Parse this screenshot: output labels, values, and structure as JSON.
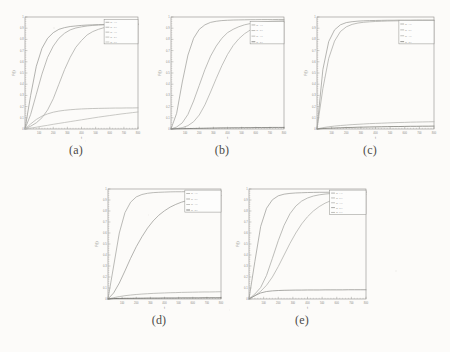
{
  "figure": {
    "background_color": "#fcfbf9",
    "panels": [
      {
        "id": "a",
        "caption": "(a)",
        "x": 12,
        "y": 14,
        "width": 128,
        "height": 126,
        "axis": {
          "xlabel": "t",
          "ylabel": "F(t)",
          "xlim": [
            0,
            800
          ],
          "ylim": [
            0,
            1
          ],
          "xticks": [
            "0",
            "100",
            "200",
            "300",
            "400",
            "500",
            "600",
            "700",
            "800"
          ],
          "yticks": [
            "0",
            "0.1",
            "0.2",
            "0.3",
            "0.4",
            "0.5",
            "0.6",
            "0.7",
            "0.8",
            "0.9",
            "1"
          ]
        },
        "legend": {
          "x": 0.7,
          "y": 0.02,
          "w": 0.3,
          "h": 0.22,
          "entries": [
            "m=1.0",
            "m=2.0",
            "m=3.0",
            "m=4.0",
            "m=5.0"
          ]
        }
      },
      {
        "id": "b",
        "caption": "(b)",
        "x": 158,
        "y": 14,
        "width": 128,
        "height": 126,
        "axis": {
          "xlabel": "t",
          "ylabel": "F(t)",
          "xlim": [
            0,
            800
          ],
          "ylim": [
            0,
            1
          ],
          "xticks": [
            "0",
            "100",
            "200",
            "300",
            "400",
            "500",
            "600",
            "700",
            "800"
          ],
          "yticks": [
            "0",
            "0.1",
            "0.2",
            "0.3",
            "0.4",
            "0.5",
            "0.6",
            "0.7",
            "0.8",
            "0.9",
            "1"
          ]
        },
        "legend": {
          "x": 0.7,
          "y": 0.04,
          "w": 0.3,
          "h": 0.2,
          "entries": [
            "m=1.0",
            "m=2.0",
            "m=3.0",
            "m=4.0"
          ]
        }
      },
      {
        "id": "c",
        "caption": "(c)",
        "x": 304,
        "y": 14,
        "width": 132,
        "height": 126,
        "axis": {
          "xlabel": "t",
          "ylabel": "F(t)",
          "xlim": [
            0,
            800
          ],
          "ylim": [
            0,
            1
          ],
          "xticks": [
            "0",
            "100",
            "200",
            "300",
            "400",
            "500",
            "600",
            "700",
            "800"
          ],
          "yticks": [
            "0",
            "0.1",
            "0.2",
            "0.3",
            "0.4",
            "0.5",
            "0.6",
            "0.7",
            "0.8",
            "0.9",
            "1"
          ]
        },
        "legend": {
          "x": 0.7,
          "y": 0.03,
          "w": 0.3,
          "h": 0.21,
          "entries": [
            "m=1.0",
            "m=2.0",
            "m=3.0",
            "m=4.0"
          ]
        }
      },
      {
        "id": "d",
        "caption": "(d)",
        "x": 95,
        "y": 186,
        "width": 128,
        "height": 124,
        "axis": {
          "xlabel": "t",
          "ylabel": "F(t)",
          "xlim": [
            0,
            800
          ],
          "ylim": [
            0,
            1
          ],
          "xticks": [
            "0",
            "100",
            "200",
            "300",
            "400",
            "500",
            "600",
            "700",
            "800"
          ],
          "yticks": [
            "0",
            "0.1",
            "0.2",
            "0.3",
            "0.4",
            "0.5",
            "0.6",
            "0.7",
            "0.8",
            "0.9",
            "1"
          ]
        },
        "legend": {
          "x": 0.68,
          "y": 0.01,
          "w": 0.32,
          "h": 0.2,
          "entries": [
            "m=1.0",
            "m=2.0",
            "m=3.0",
            "m=4.0"
          ]
        }
      },
      {
        "id": "e",
        "caption": "(e)",
        "x": 236,
        "y": 186,
        "width": 132,
        "height": 124,
        "axis": {
          "xlabel": "t",
          "ylabel": "F(t)",
          "xlim": [
            0,
            800
          ],
          "ylim": [
            0,
            1
          ],
          "xticks": [
            "0",
            "100",
            "200",
            "300",
            "400",
            "500",
            "600",
            "700",
            "800"
          ],
          "yticks": [
            "0",
            "0.1",
            "0.2",
            "0.3",
            "0.4",
            "0.5",
            "0.6",
            "0.7",
            "0.8",
            "0.9",
            "1"
          ]
        },
        "legend": {
          "x": 0.69,
          "y": 0.01,
          "w": 0.31,
          "h": 0.22,
          "entries": [
            "m=1.0",
            "m=2.0",
            "m=3.0",
            "m=4.0",
            "m=5.0"
          ]
        }
      }
    ]
  },
  "chart_data": [
    {
      "panel": "a",
      "type": "line",
      "title": "",
      "xlabel": "t",
      "ylabel": "F(t)",
      "xlim": [
        0,
        800
      ],
      "ylim": [
        0,
        1
      ],
      "grid": false,
      "legend_position": "upper-right",
      "x": [
        0,
        40,
        80,
        120,
        160,
        200,
        240,
        280,
        320,
        360,
        400,
        440,
        480,
        520,
        560,
        600,
        640,
        680,
        720,
        760,
        800
      ],
      "series": [
        {
          "name": "m=1.0",
          "color": "#9a9a96",
          "values": [
            0.0,
            0.3,
            0.56,
            0.72,
            0.81,
            0.86,
            0.89,
            0.905,
            0.915,
            0.92,
            0.925,
            0.928,
            0.93,
            0.932,
            0.933,
            0.934,
            0.935,
            0.936,
            0.936,
            0.937,
            0.937
          ]
        },
        {
          "name": "m=2.0",
          "color": "#a5a5a1",
          "values": [
            0.0,
            0.13,
            0.31,
            0.49,
            0.64,
            0.74,
            0.81,
            0.855,
            0.885,
            0.902,
            0.912,
            0.92,
            0.925,
            0.928,
            0.93,
            0.932,
            0.933,
            0.934,
            0.935,
            0.936,
            0.936
          ]
        },
        {
          "name": "m=3.0",
          "color": "#aaaaa6",
          "values": [
            0.0,
            0.025,
            0.055,
            0.1,
            0.17,
            0.27,
            0.4,
            0.53,
            0.64,
            0.73,
            0.79,
            0.84,
            0.87,
            0.89,
            0.905,
            0.915,
            0.921,
            0.925,
            0.928,
            0.93,
            0.932
          ]
        },
        {
          "name": "m=4.0",
          "color": "#b2b2ae",
          "values": [
            0.0,
            0.045,
            0.085,
            0.115,
            0.135,
            0.15,
            0.16,
            0.167,
            0.172,
            0.176,
            0.179,
            0.181,
            0.183,
            0.184,
            0.185,
            0.186,
            0.187,
            0.187,
            0.188,
            0.188,
            0.189
          ]
        },
        {
          "name": "m=5.0",
          "color": "#b8b8b4",
          "values": [
            0.0,
            0.008,
            0.016,
            0.025,
            0.033,
            0.042,
            0.05,
            0.058,
            0.066,
            0.074,
            0.082,
            0.09,
            0.098,
            0.106,
            0.113,
            0.12,
            0.127,
            0.134,
            0.14,
            0.146,
            0.152
          ]
        }
      ]
    },
    {
      "panel": "b",
      "type": "line",
      "title": "",
      "xlabel": "t",
      "ylabel": "F(t)",
      "xlim": [
        0,
        800
      ],
      "ylim": [
        0,
        1
      ],
      "grid": false,
      "legend_position": "upper-right",
      "x": [
        0,
        40,
        80,
        120,
        160,
        200,
        240,
        280,
        320,
        360,
        400,
        440,
        480,
        520,
        560,
        600,
        640,
        680,
        720,
        760,
        800
      ],
      "series": [
        {
          "name": "m=1.0",
          "color": "#a0a09c",
          "values": [
            0.0,
            0.14,
            0.42,
            0.66,
            0.81,
            0.89,
            0.93,
            0.952,
            0.962,
            0.968,
            0.971,
            0.973,
            0.974,
            0.975,
            0.976,
            0.976,
            0.977,
            0.977,
            0.977,
            0.978,
            0.978
          ]
        },
        {
          "name": "m=2.0",
          "color": "#a8a8a4",
          "values": [
            0.0,
            0.018,
            0.055,
            0.13,
            0.25,
            0.39,
            0.53,
            0.65,
            0.74,
            0.81,
            0.86,
            0.89,
            0.913,
            0.93,
            0.941,
            0.949,
            0.955,
            0.959,
            0.962,
            0.964,
            0.966
          ]
        },
        {
          "name": "m=3.0",
          "color": "#aeaeaa",
          "values": [
            0.0,
            0.004,
            0.012,
            0.03,
            0.065,
            0.125,
            0.215,
            0.33,
            0.45,
            0.565,
            0.665,
            0.745,
            0.805,
            0.85,
            0.883,
            0.906,
            0.922,
            0.934,
            0.942,
            0.948,
            0.953
          ]
        },
        {
          "name": "m=4.0",
          "color": "#6e6e6a",
          "values": [
            0.0,
            0.002,
            0.003,
            0.004,
            0.005,
            0.006,
            0.007,
            0.008,
            0.009,
            0.01,
            0.01,
            0.011,
            0.011,
            0.012,
            0.012,
            0.013,
            0.013,
            0.013,
            0.014,
            0.014,
            0.014
          ]
        }
      ]
    },
    {
      "panel": "c",
      "type": "line",
      "title": "",
      "xlabel": "t",
      "ylabel": "F(t)",
      "xlim": [
        0,
        800
      ],
      "ylim": [
        0,
        1
      ],
      "grid": false,
      "legend_position": "upper-right",
      "x": [
        0,
        40,
        80,
        120,
        160,
        200,
        240,
        280,
        320,
        360,
        400,
        440,
        480,
        520,
        560,
        600,
        640,
        680,
        720,
        760,
        800
      ],
      "series": [
        {
          "name": "m=1.0",
          "color": "#9d9d99",
          "values": [
            0.0,
            0.53,
            0.78,
            0.885,
            0.93,
            0.95,
            0.958,
            0.963,
            0.966,
            0.968,
            0.969,
            0.97,
            0.971,
            0.971,
            0.972,
            0.972,
            0.972,
            0.973,
            0.973,
            0.973,
            0.973
          ]
        },
        {
          "name": "m=2.0",
          "color": "#a9a9a5",
          "values": [
            0.0,
            0.36,
            0.63,
            0.785,
            0.87,
            0.912,
            0.934,
            0.946,
            0.953,
            0.957,
            0.96,
            0.962,
            0.964,
            0.965,
            0.966,
            0.966,
            0.967,
            0.967,
            0.968,
            0.968,
            0.968
          ]
        },
        {
          "name": "m=3.0",
          "color": "#b0b0ac",
          "values": [
            0.0,
            0.012,
            0.02,
            0.026,
            0.031,
            0.035,
            0.039,
            0.042,
            0.045,
            0.048,
            0.05,
            0.052,
            0.054,
            0.056,
            0.058,
            0.059,
            0.061,
            0.062,
            0.063,
            0.064,
            0.065
          ]
        },
        {
          "name": "m=4.0",
          "color": "#76766f",
          "values": [
            0.0,
            0.004,
            0.007,
            0.009,
            0.011,
            0.013,
            0.014,
            0.016,
            0.017,
            0.018,
            0.019,
            0.02,
            0.021,
            0.022,
            0.022,
            0.023,
            0.024,
            0.024,
            0.025,
            0.025,
            0.026
          ]
        }
      ]
    },
    {
      "panel": "d",
      "type": "line",
      "title": "",
      "xlabel": "t",
      "ylabel": "F(t)",
      "xlim": [
        0,
        800
      ],
      "ylim": [
        0,
        1
      ],
      "grid": false,
      "legend_position": "upper-right",
      "x": [
        0,
        40,
        80,
        120,
        160,
        200,
        240,
        280,
        320,
        360,
        400,
        440,
        480,
        520,
        560,
        600,
        640,
        680,
        720,
        760,
        800
      ],
      "series": [
        {
          "name": "m=1.0",
          "color": "#a4a4a0",
          "values": [
            0.0,
            0.3,
            0.6,
            0.785,
            0.88,
            0.928,
            0.95,
            0.961,
            0.967,
            0.97,
            0.972,
            0.974,
            0.975,
            0.975,
            0.976,
            0.976,
            0.977,
            0.977,
            0.977,
            0.978,
            0.978
          ]
        },
        {
          "name": "m=2.0",
          "color": "#9b9b97",
          "values": [
            0.0,
            0.055,
            0.145,
            0.255,
            0.37,
            0.475,
            0.565,
            0.645,
            0.71,
            0.762,
            0.802,
            0.835,
            0.86,
            0.88,
            0.895,
            0.908,
            0.917,
            0.925,
            0.931,
            0.936,
            0.94
          ]
        },
        {
          "name": "m=3.0",
          "color": "#aeaeaa",
          "values": [
            0.0,
            0.012,
            0.022,
            0.03,
            0.036,
            0.041,
            0.045,
            0.048,
            0.051,
            0.053,
            0.055,
            0.057,
            0.058,
            0.06,
            0.061,
            0.062,
            0.063,
            0.064,
            0.064,
            0.065,
            0.066
          ]
        },
        {
          "name": "m=4.0",
          "color": "#5f5f5b",
          "values": [
            0.0,
            0.004,
            0.005,
            0.006,
            0.006,
            0.007,
            0.007,
            0.008,
            0.008,
            0.008,
            0.009,
            0.009,
            0.009,
            0.01,
            0.01,
            0.01,
            0.01,
            0.011,
            0.011,
            0.011,
            0.011
          ]
        }
      ]
    },
    {
      "panel": "e",
      "type": "line",
      "title": "",
      "xlabel": "t",
      "ylabel": "F(t)",
      "xlim": [
        0,
        800
      ],
      "ylim": [
        0,
        1
      ],
      "grid": false,
      "legend_position": "upper-right",
      "x": [
        0,
        40,
        80,
        120,
        160,
        200,
        240,
        280,
        320,
        360,
        400,
        440,
        480,
        520,
        560,
        600,
        640,
        680,
        720,
        760,
        800
      ],
      "series": [
        {
          "name": "m=1.0",
          "color": "#9e9e9a",
          "values": [
            0.0,
            0.34,
            0.66,
            0.825,
            0.902,
            0.938,
            0.953,
            0.96,
            0.964,
            0.966,
            0.968,
            0.969,
            0.97,
            0.97,
            0.971,
            0.971,
            0.972,
            0.972,
            0.972,
            0.973,
            0.973
          ]
        },
        {
          "name": "m=2.0",
          "color": "#a7a7a3",
          "values": [
            0.0,
            0.045,
            0.105,
            0.215,
            0.37,
            0.53,
            0.67,
            0.775,
            0.845,
            0.89,
            0.918,
            0.936,
            0.947,
            0.954,
            0.959,
            0.962,
            0.964,
            0.966,
            0.967,
            0.968,
            0.969
          ]
        },
        {
          "name": "m=3.0",
          "color": "#afafab",
          "values": [
            0.0,
            0.03,
            0.07,
            0.125,
            0.2,
            0.295,
            0.4,
            0.505,
            0.6,
            0.682,
            0.748,
            0.8,
            0.84,
            0.871,
            0.894,
            0.911,
            0.924,
            0.934,
            0.941,
            0.947,
            0.951
          ]
        },
        {
          "name": "m=4.0",
          "color": "#8d8d89",
          "values": [
            0.0,
            0.03,
            0.055,
            0.068,
            0.074,
            0.077,
            0.079,
            0.08,
            0.081,
            0.081,
            0.082,
            0.082,
            0.082,
            0.083,
            0.083,
            0.083,
            0.083,
            0.084,
            0.084,
            0.084,
            0.084
          ]
        }
      ]
    }
  ]
}
